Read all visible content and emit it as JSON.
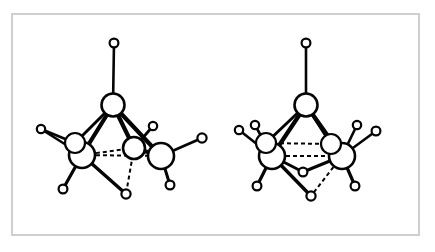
{
  "figure": {
    "kind": "molecular-structure-diagram",
    "background_color": "#ffffff",
    "frame_color": "#cfcfcf",
    "line_color": "#050505",
    "atom_fill_color": "#ffffff",
    "panel_count": 2,
    "caption": ""
  },
  "chart_data": {
    "type": "diagram",
    "title": "",
    "xlabel": "",
    "ylabel": "",
    "models": [
      {
        "name": "left-model",
        "label": "",
        "atoms": [
          {
            "id": "L-H-apex",
            "element": "H",
            "x": 114,
            "y": 43,
            "r": 4.4
          },
          {
            "id": "L-C-apex",
            "element": "C",
            "x": 113,
            "y": 105,
            "r": 11.5
          },
          {
            "id": "L-C-left",
            "element": "C",
            "x": 82,
            "y": 155,
            "r": 13.0
          },
          {
            "id": "L-C-mid",
            "element": "C",
            "x": 134,
            "y": 148,
            "r": 11.0
          },
          {
            "id": "L-C-right",
            "element": "C",
            "x": 161,
            "y": 156,
            "r": 13.0
          },
          {
            "id": "L-C-ghost",
            "element": "C",
            "x": 75,
            "y": 143,
            "r": 10.0
          },
          {
            "id": "L-H-fl",
            "element": "H",
            "x": 41,
            "y": 129,
            "r": 4.2
          },
          {
            "id": "L-H-bl",
            "element": "H",
            "x": 63,
            "y": 189,
            "r": 4.4
          },
          {
            "id": "L-H-midtop",
            "element": "H",
            "x": 153,
            "y": 126,
            "r": 4.2
          },
          {
            "id": "L-H-fr",
            "element": "H",
            "x": 202,
            "y": 138,
            "r": 4.6
          },
          {
            "id": "L-H-br",
            "element": "H",
            "x": 170,
            "y": 185,
            "r": 4.4
          },
          {
            "id": "L-H-bot",
            "element": "H",
            "x": 126,
            "y": 194,
            "r": 4.6
          }
        ],
        "bonds": [
          {
            "from": "L-H-apex",
            "to": "L-C-apex",
            "style": "solid",
            "width": 2.6
          },
          {
            "from": "L-C-apex",
            "to": "L-C-left",
            "style": "solid",
            "width": 4.2
          },
          {
            "from": "L-C-apex",
            "to": "L-C-mid",
            "style": "solid",
            "width": 4.2
          },
          {
            "from": "L-C-apex",
            "to": "L-C-right",
            "style": "solid",
            "width": 4.2
          },
          {
            "from": "L-C-apex",
            "to": "L-C-ghost",
            "style": "solid",
            "width": 3.0
          },
          {
            "from": "L-C-left",
            "to": "L-C-mid",
            "style": "dashed",
            "width": 2.0
          },
          {
            "from": "L-C-left",
            "to": "L-C-right",
            "style": "dashed",
            "width": 2.0
          },
          {
            "from": "L-C-mid",
            "to": "L-C-right",
            "style": "solid",
            "width": 4.0
          },
          {
            "from": "L-C-left",
            "to": "L-H-fl",
            "style": "solid",
            "width": 2.6
          },
          {
            "from": "L-C-ghost",
            "to": "L-H-fl",
            "style": "solid",
            "width": 2.6
          },
          {
            "from": "L-C-left",
            "to": "L-H-bl",
            "style": "solid",
            "width": 3.2
          },
          {
            "from": "L-C-mid",
            "to": "L-H-midtop",
            "style": "solid",
            "width": 2.8
          },
          {
            "from": "L-C-right",
            "to": "L-H-fr",
            "style": "solid",
            "width": 2.8
          },
          {
            "from": "L-C-right",
            "to": "L-H-br",
            "style": "solid",
            "width": 3.0
          },
          {
            "from": "L-C-left",
            "to": "L-H-bot",
            "style": "solid",
            "width": 3.4
          },
          {
            "from": "L-C-left",
            "to": "L-H-bot",
            "style": "dashed",
            "width": 2.0
          },
          {
            "from": "L-C-mid",
            "to": "L-H-bot",
            "style": "dashed",
            "width": 2.0
          }
        ]
      },
      {
        "name": "right-model",
        "label": "",
        "atoms": [
          {
            "id": "R-H-apex",
            "element": "H",
            "x": 306,
            "y": 43,
            "r": 4.4
          },
          {
            "id": "R-C-apex",
            "element": "C",
            "x": 306,
            "y": 105,
            "r": 11.5
          },
          {
            "id": "R-C-left",
            "element": "C",
            "x": 272,
            "y": 156,
            "r": 13.0
          },
          {
            "id": "R-C-right",
            "element": "C",
            "x": 342,
            "y": 156,
            "r": 13.0
          },
          {
            "id": "R-C-gl",
            "element": "C",
            "x": 266,
            "y": 143,
            "r": 10.0
          },
          {
            "id": "R-C-gr",
            "element": "C",
            "x": 331,
            "y": 144,
            "r": 10.0
          },
          {
            "id": "R-H-fl",
            "element": "H",
            "x": 239,
            "y": 130,
            "r": 4.2
          },
          {
            "id": "R-H-ul",
            "element": "H",
            "x": 255,
            "y": 125,
            "r": 4.2
          },
          {
            "id": "R-H-bl",
            "element": "H",
            "x": 257,
            "y": 186,
            "r": 4.4
          },
          {
            "id": "R-H-ur",
            "element": "H",
            "x": 357,
            "y": 125,
            "r": 4.2
          },
          {
            "id": "R-H-fr",
            "element": "H",
            "x": 376,
            "y": 131,
            "r": 4.4
          },
          {
            "id": "R-H-br",
            "element": "H",
            "x": 355,
            "y": 186,
            "r": 4.4
          },
          {
            "id": "R-H-midbot",
            "element": "H",
            "x": 303,
            "y": 172,
            "r": 4.4
          },
          {
            "id": "R-H-bot",
            "element": "H",
            "x": 311,
            "y": 196,
            "r": 4.6
          }
        ],
        "bonds": [
          {
            "from": "R-H-apex",
            "to": "R-C-apex",
            "style": "solid",
            "width": 2.6
          },
          {
            "from": "R-C-apex",
            "to": "R-C-left",
            "style": "solid",
            "width": 4.2
          },
          {
            "from": "R-C-apex",
            "to": "R-C-right",
            "style": "solid",
            "width": 4.2
          },
          {
            "from": "R-C-apex",
            "to": "R-C-gl",
            "style": "solid",
            "width": 3.0
          },
          {
            "from": "R-C-apex",
            "to": "R-C-gr",
            "style": "solid",
            "width": 3.0
          },
          {
            "from": "R-C-left",
            "to": "R-C-right",
            "style": "dashed",
            "width": 2.0
          },
          {
            "from": "R-C-gl",
            "to": "R-C-gr",
            "style": "dashed",
            "width": 2.0
          },
          {
            "from": "R-C-left",
            "to": "R-H-fl",
            "style": "solid",
            "width": 2.6
          },
          {
            "from": "R-C-left",
            "to": "R-H-ul",
            "style": "solid",
            "width": 2.6
          },
          {
            "from": "R-C-left",
            "to": "R-H-bl",
            "style": "solid",
            "width": 3.2
          },
          {
            "from": "R-C-right",
            "to": "R-H-ur",
            "style": "solid",
            "width": 2.6
          },
          {
            "from": "R-C-right",
            "to": "R-H-fr",
            "style": "solid",
            "width": 2.6
          },
          {
            "from": "R-C-right",
            "to": "R-H-br",
            "style": "solid",
            "width": 3.2
          },
          {
            "from": "R-C-left",
            "to": "R-H-midbot",
            "style": "solid",
            "width": 3.0
          },
          {
            "from": "R-C-right",
            "to": "R-H-midbot",
            "style": "solid",
            "width": 3.0
          },
          {
            "from": "R-C-left",
            "to": "R-H-bot",
            "style": "solid",
            "width": 3.4
          },
          {
            "from": "R-C-right",
            "to": "R-H-bot",
            "style": "dashed",
            "width": 2.0
          }
        ]
      }
    ]
  }
}
